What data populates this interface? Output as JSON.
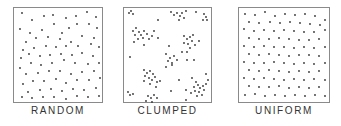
{
  "figure": {
    "panels": [
      {
        "id": "random",
        "label": "RANDOM",
        "box": {
          "x": 13,
          "y": 7,
          "w": 90,
          "h": 96
        },
        "label_x": 13,
        "label_w": 90,
        "dots": [
          [
            8,
            5
          ],
          [
            18,
            12
          ],
          [
            30,
            8
          ],
          [
            39,
            7
          ],
          [
            52,
            10
          ],
          [
            62,
            8
          ],
          [
            73,
            4
          ],
          [
            82,
            9
          ],
          [
            83,
            20
          ],
          [
            75,
            16
          ],
          [
            63,
            16
          ],
          [
            55,
            20
          ],
          [
            48,
            25
          ],
          [
            40,
            16
          ],
          [
            28,
            22
          ],
          [
            16,
            25
          ],
          [
            6,
            21
          ],
          [
            12,
            34
          ],
          [
            22,
            30
          ],
          [
            34,
            29
          ],
          [
            46,
            31
          ],
          [
            57,
            34
          ],
          [
            68,
            28
          ],
          [
            80,
            30
          ],
          [
            85,
            39
          ],
          [
            77,
            36
          ],
          [
            64,
            38
          ],
          [
            52,
            38
          ],
          [
            42,
            39
          ],
          [
            32,
            38
          ],
          [
            20,
            40
          ],
          [
            9,
            42
          ],
          [
            7,
            50
          ],
          [
            15,
            46
          ],
          [
            26,
            48
          ],
          [
            36,
            47
          ],
          [
            47,
            46
          ],
          [
            58,
            47
          ],
          [
            68,
            45
          ],
          [
            79,
            48
          ],
          [
            85,
            55
          ],
          [
            74,
            56
          ],
          [
            61,
            55
          ],
          [
            50,
            52
          ],
          [
            38,
            55
          ],
          [
            27,
            57
          ],
          [
            17,
            55
          ],
          [
            6,
            60
          ],
          [
            12,
            66
          ],
          [
            24,
            65
          ],
          [
            35,
            63
          ],
          [
            46,
            63
          ],
          [
            57,
            66
          ],
          [
            68,
            64
          ],
          [
            80,
            63
          ],
          [
            86,
            70
          ],
          [
            75,
            72
          ],
          [
            63,
            72
          ],
          [
            52,
            75
          ],
          [
            42,
            71
          ],
          [
            30,
            73
          ],
          [
            19,
            73
          ],
          [
            9,
            76
          ],
          [
            14,
            84
          ],
          [
            26,
            82
          ],
          [
            37,
            81
          ],
          [
            48,
            83
          ],
          [
            59,
            81
          ],
          [
            70,
            82
          ],
          [
            82,
            80
          ],
          [
            85,
            88
          ],
          [
            74,
            89
          ],
          [
            63,
            88
          ],
          [
            52,
            91
          ],
          [
            40,
            89
          ],
          [
            29,
            89
          ],
          [
            18,
            90
          ],
          [
            8,
            89
          ]
        ],
        "dot_color": "#333333"
      },
      {
        "id": "clumped",
        "label": "CLUMPED",
        "box": {
          "x": 123,
          "y": 7,
          "w": 89,
          "h": 96
        },
        "label_x": 123,
        "label_w": 89,
        "dots": [
          [
            5,
            5
          ],
          [
            7,
            3
          ],
          [
            9,
            6
          ],
          [
            34,
            12
          ],
          [
            47,
            4
          ],
          [
            50,
            7
          ],
          [
            53,
            5
          ],
          [
            56,
            8
          ],
          [
            58,
            5
          ],
          [
            60,
            10
          ],
          [
            55,
            12
          ],
          [
            62,
            3
          ],
          [
            72,
            4
          ],
          [
            80,
            6
          ],
          [
            82,
            9
          ],
          [
            83,
            12
          ],
          [
            79,
            12
          ],
          [
            9,
            23
          ],
          [
            12,
            20
          ],
          [
            15,
            24
          ],
          [
            11,
            27
          ],
          [
            17,
            27
          ],
          [
            20,
            23
          ],
          [
            23,
            26
          ],
          [
            19,
            30
          ],
          [
            14,
            31
          ],
          [
            25,
            31
          ],
          [
            28,
            28
          ],
          [
            30,
            23
          ],
          [
            34,
            30
          ],
          [
            10,
            34
          ],
          [
            20,
            37
          ],
          [
            45,
            38
          ],
          [
            60,
            28
          ],
          [
            63,
            31
          ],
          [
            66,
            29
          ],
          [
            68,
            33
          ],
          [
            64,
            36
          ],
          [
            60,
            35
          ],
          [
            66,
            40
          ],
          [
            71,
            37
          ],
          [
            75,
            33
          ],
          [
            69,
            27
          ],
          [
            63,
            44
          ],
          [
            58,
            44
          ],
          [
            63,
            52
          ],
          [
            70,
            52
          ],
          [
            42,
            46
          ],
          [
            46,
            50
          ],
          [
            50,
            48
          ],
          [
            44,
            53
          ],
          [
            48,
            55
          ],
          [
            53,
            52
          ],
          [
            42,
            59
          ],
          [
            48,
            57
          ],
          [
            6,
            49
          ],
          [
            20,
            62
          ],
          [
            23,
            65
          ],
          [
            26,
            63
          ],
          [
            29,
            66
          ],
          [
            21,
            68
          ],
          [
            25,
            70
          ],
          [
            28,
            72
          ],
          [
            31,
            69
          ],
          [
            20,
            73
          ],
          [
            33,
            74
          ],
          [
            26,
            76
          ],
          [
            32,
            79
          ],
          [
            36,
            73
          ],
          [
            55,
            72
          ],
          [
            68,
            70
          ],
          [
            72,
            74
          ],
          [
            74,
            77
          ],
          [
            70,
            79
          ],
          [
            76,
            80
          ],
          [
            79,
            78
          ],
          [
            82,
            76
          ],
          [
            80,
            82
          ],
          [
            75,
            84
          ],
          [
            71,
            83
          ],
          [
            67,
            85
          ],
          [
            73,
            88
          ],
          [
            78,
            87
          ],
          [
            62,
            82
          ],
          [
            84,
            72
          ],
          [
            82,
            66
          ],
          [
            4,
            84
          ],
          [
            6,
            87
          ],
          [
            9,
            86
          ],
          [
            47,
            83
          ],
          [
            62,
            92
          ],
          [
            24,
            88
          ],
          [
            27,
            90
          ],
          [
            30,
            87
          ],
          [
            33,
            90
          ],
          [
            28,
            94
          ],
          [
            22,
            93
          ]
        ],
        "dot_color": "#333333"
      },
      {
        "id": "uniform",
        "label": "UNIFORM",
        "box": {
          "x": 238,
          "y": 7,
          "w": 92,
          "h": 96
        },
        "label_x": 238,
        "label_w": 92,
        "dots": [
          [
            6,
            6
          ],
          [
            16,
            7
          ],
          [
            26,
            4
          ],
          [
            36,
            8
          ],
          [
            46,
            6
          ],
          [
            56,
            7
          ],
          [
            66,
            6
          ],
          [
            76,
            8
          ],
          [
            86,
            12
          ],
          [
            10,
            14
          ],
          [
            20,
            15
          ],
          [
            31,
            14
          ],
          [
            41,
            15
          ],
          [
            51,
            14
          ],
          [
            61,
            15
          ],
          [
            71,
            16
          ],
          [
            81,
            17
          ],
          [
            5,
            21
          ],
          [
            15,
            23
          ],
          [
            25,
            22
          ],
          [
            35,
            23
          ],
          [
            45,
            22
          ],
          [
            55,
            23
          ],
          [
            65,
            24
          ],
          [
            75,
            24
          ],
          [
            86,
            22
          ],
          [
            10,
            30
          ],
          [
            20,
            31
          ],
          [
            30,
            31
          ],
          [
            40,
            30
          ],
          [
            50,
            31
          ],
          [
            60,
            32
          ],
          [
            70,
            32
          ],
          [
            80,
            31
          ],
          [
            5,
            38
          ],
          [
            15,
            39
          ],
          [
            25,
            38
          ],
          [
            35,
            39
          ],
          [
            45,
            39
          ],
          [
            55,
            40
          ],
          [
            65,
            39
          ],
          [
            75,
            40
          ],
          [
            86,
            39
          ],
          [
            10,
            46
          ],
          [
            20,
            47
          ],
          [
            30,
            46
          ],
          [
            40,
            47
          ],
          [
            50,
            48
          ],
          [
            60,
            47
          ],
          [
            70,
            47
          ],
          [
            80,
            48
          ],
          [
            5,
            54
          ],
          [
            15,
            55
          ],
          [
            25,
            55
          ],
          [
            35,
            54
          ],
          [
            45,
            55
          ],
          [
            55,
            56
          ],
          [
            65,
            55
          ],
          [
            75,
            56
          ],
          [
            86,
            55
          ],
          [
            10,
            62
          ],
          [
            20,
            63
          ],
          [
            30,
            62
          ],
          [
            40,
            63
          ],
          [
            50,
            64
          ],
          [
            60,
            63
          ],
          [
            70,
            64
          ],
          [
            80,
            63
          ],
          [
            5,
            70
          ],
          [
            15,
            71
          ],
          [
            25,
            70
          ],
          [
            35,
            71
          ],
          [
            45,
            72
          ],
          [
            55,
            71
          ],
          [
            65,
            72
          ],
          [
            75,
            71
          ],
          [
            86,
            72
          ],
          [
            10,
            78
          ],
          [
            20,
            79
          ],
          [
            30,
            79
          ],
          [
            40,
            78
          ],
          [
            50,
            80
          ],
          [
            60,
            79
          ],
          [
            70,
            80
          ],
          [
            80,
            79
          ],
          [
            6,
            87
          ],
          [
            16,
            86
          ],
          [
            26,
            88
          ],
          [
            36,
            87
          ],
          [
            46,
            88
          ],
          [
            56,
            87
          ],
          [
            66,
            88
          ],
          [
            76,
            87
          ],
          [
            86,
            88
          ]
        ],
        "dot_color": "#333333"
      }
    ]
  },
  "colors": {
    "background": "#ffffff",
    "border": "#8a8a8a",
    "text": "#333333"
  }
}
